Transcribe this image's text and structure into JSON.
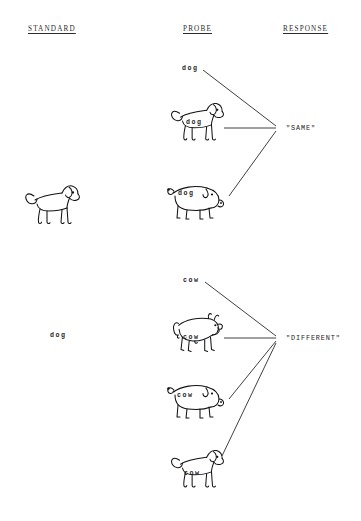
{
  "figure": {
    "background_color": "#ffffff",
    "ink_color": "#111111",
    "line_color": "#2a2a2a"
  },
  "columns": {
    "standard": "STANDARD",
    "probe": "PROBE",
    "response": "RESPONSE"
  },
  "trials": [
    {
      "id": "same-trial",
      "standard": {
        "type": "picture",
        "depicts": "dog",
        "label": ""
      },
      "probes": [
        {
          "id": "probe-word-dog",
          "kind": "word",
          "word": "dog",
          "depicts": "",
          "label": "dog"
        },
        {
          "id": "probe-dog-dog",
          "kind": "picture",
          "word": "dog",
          "depicts": "dog",
          "label": "dog"
        },
        {
          "id": "probe-pig-dog",
          "kind": "picture",
          "word": "dog",
          "depicts": "pig",
          "label": "dog"
        }
      ],
      "response": "\"SAME\""
    },
    {
      "id": "different-trial",
      "standard": {
        "type": "word",
        "depicts": "",
        "label": "dog"
      },
      "probes": [
        {
          "id": "probe-word-cow",
          "kind": "word",
          "word": "cow",
          "depicts": "",
          "label": "cow"
        },
        {
          "id": "probe-cow-cow",
          "kind": "picture",
          "word": "cow",
          "depicts": "cow",
          "label": "cow"
        },
        {
          "id": "probe-pig-cow",
          "kind": "picture",
          "word": "cow",
          "depicts": "pig",
          "label": "cow"
        },
        {
          "id": "probe-dog-cow",
          "kind": "picture",
          "word": "cow",
          "depicts": "dog",
          "label": "cow"
        }
      ],
      "response": "\"DIFFERENT\""
    }
  ],
  "labels": {
    "std_dog_word": "dog",
    "same_probe_word": "dog",
    "same_dog_pic_word": "dog",
    "same_pig_pic_word": "dog",
    "diff_probe_word": "cow",
    "diff_cow_pic_word": "cow",
    "diff_pig_pic_word": "cow",
    "diff_dog_pic_word": "cow",
    "response_same": "\"SAME\"",
    "response_different": "\"DIFFERENT\""
  }
}
